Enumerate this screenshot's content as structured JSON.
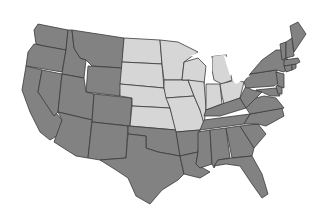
{
  "map": {
    "title": "United States - Midwest region highlighted",
    "colors": {
      "background": "#ffffff",
      "other_states": "#828282",
      "highlighted_states": "#d6d6d6",
      "borders": "#3a3a3a"
    },
    "legend_visible": false,
    "highlighted_region": "Midwest",
    "highlighted_states": [
      "ND",
      "SD",
      "NE",
      "KS",
      "MN",
      "IA",
      "MO",
      "WI",
      "IL",
      "MI",
      "IN",
      "OH"
    ],
    "states": [
      {
        "id": "WA",
        "region": "other",
        "points": "38,24 68,30 66,50 44,46 36,44 34,30"
      },
      {
        "id": "OR",
        "region": "other",
        "points": "34,44 44,46 66,50 62,72 26,66 28,52"
      },
      {
        "id": "CA",
        "region": "other",
        "points": "26,66 42,70 38,92 62,120 60,134 50,140 40,132 30,112 22,90"
      },
      {
        "id": "ID",
        "region": "other",
        "points": "68,30 72,30 74,48 80,58 86,60 84,78 62,74 66,50"
      },
      {
        "id": "NV",
        "region": "other",
        "points": "42,70 62,74 58,112 54,116 38,92"
      },
      {
        "id": "MT",
        "region": "other",
        "points": "72,30 124,38 122,68 92,66 86,60 80,58 74,48"
      },
      {
        "id": "WY",
        "region": "other",
        "points": "88,66 122,68 120,96 86,92"
      },
      {
        "id": "UT",
        "region": "other",
        "points": "62,74 84,78 86,92 94,94 92,120 58,112"
      },
      {
        "id": "CO",
        "region": "other",
        "points": "94,94 132,98 130,126 92,122"
      },
      {
        "id": "AZ",
        "region": "other",
        "points": "58,112 92,120 88,158 76,156 54,142 62,120"
      },
      {
        "id": "NM",
        "region": "other",
        "points": "92,122 128,126 126,158 100,160 88,158"
      },
      {
        "id": "ND",
        "region": "highlight",
        "points": "124,38 160,40 162,64 122,62"
      },
      {
        "id": "SD",
        "region": "highlight",
        "points": "122,62 162,64 164,88 120,84"
      },
      {
        "id": "NE",
        "region": "highlight",
        "points": "120,84 164,88 170,108 132,106 132,98 120,96"
      },
      {
        "id": "KS",
        "region": "highlight",
        "points": "132,106 170,108 176,130 130,126"
      },
      {
        "id": "OK",
        "region": "other",
        "points": "128,126 176,130 180,156 158,152 146,148 146,136 128,134"
      },
      {
        "id": "TX",
        "region": "other",
        "points": "128,134 146,136 146,148 158,152 180,156 184,174 178,180 162,190 150,204 136,196 128,178 116,170 100,160 126,158"
      },
      {
        "id": "MN",
        "region": "highlight",
        "points": "160,40 178,42 198,52 184,62 182,80 164,80 162,64"
      },
      {
        "id": "IA",
        "region": "highlight",
        "points": "164,80 188,80 194,96 166,98 164,88"
      },
      {
        "id": "MO",
        "region": "highlight",
        "points": "166,98 194,96 200,110 206,124 200,130 176,132 170,108"
      },
      {
        "id": "AR",
        "region": "other",
        "points": "176,132 200,130 198,152 180,156"
      },
      {
        "id": "LA",
        "region": "other",
        "points": "180,156 198,152 196,164 210,172 200,178 184,174"
      },
      {
        "id": "WI",
        "region": "highlight",
        "points": "184,62 198,58 206,66 204,84 188,80 182,80"
      },
      {
        "id": "IL",
        "region": "highlight",
        "points": "188,80 204,82 206,108 204,124 200,110 194,96"
      },
      {
        "id": "MI",
        "region": "highlight",
        "points": "212,56 226,54 232,80 222,84 214,80 212,70"
      },
      {
        "id": "IN",
        "region": "highlight",
        "points": "206,84 220,84 222,104 206,110"
      },
      {
        "id": "OH",
        "region": "highlight",
        "points": "220,84 236,80 244,82 240,98 224,104 222,96"
      },
      {
        "id": "KY",
        "region": "other",
        "points": "204,116 206,110 222,104 240,98 246,108 220,116"
      },
      {
        "id": "TN",
        "region": "other",
        "points": "200,130 204,120 250,114 244,124 200,130"
      },
      {
        "id": "MS",
        "region": "other",
        "points": "198,132 210,130 212,164 200,168 196,164 198,152"
      },
      {
        "id": "AL",
        "region": "other",
        "points": "210,130 226,128 230,158 218,160 214,168 212,164"
      },
      {
        "id": "GA",
        "region": "other",
        "points": "226,128 240,126 254,148 252,156 232,158"
      },
      {
        "id": "FL",
        "region": "other",
        "points": "214,166 218,160 232,158 252,156 262,174 268,194 262,198 252,184 240,166 226,164"
      },
      {
        "id": "SC",
        "region": "other",
        "points": "240,126 258,124 266,134 254,148"
      },
      {
        "id": "NC",
        "region": "other",
        "points": "244,124 250,114 282,108 284,116 266,126 258,124"
      },
      {
        "id": "VA",
        "region": "other",
        "points": "246,108 256,98 264,96 276,98 284,108 250,114"
      },
      {
        "id": "WV",
        "region": "other",
        "points": "240,98 246,86 252,90 262,92 256,98 246,108"
      },
      {
        "id": "PA",
        "region": "other",
        "points": "244,82 250,74 276,70 282,80 274,86 246,88"
      },
      {
        "id": "MD",
        "region": "other",
        "points": "256,90 276,88 280,96 270,96 262,92"
      },
      {
        "id": "DE",
        "region": "other",
        "points": "276,86 282,84 282,94 278,94"
      },
      {
        "id": "NJ",
        "region": "other",
        "points": "276,72 284,74 284,88 278,86"
      },
      {
        "id": "NY",
        "region": "other",
        "points": "250,74 262,60 276,50 286,50 288,66 284,72 276,70"
      },
      {
        "id": "CT",
        "region": "other",
        "points": "284,66 292,64 292,70 286,72"
      },
      {
        "id": "RI",
        "region": "other",
        "points": "292,64 296,64 296,68 292,70"
      },
      {
        "id": "MA",
        "region": "other",
        "points": "284,60 298,58 300,62 296,64 284,66"
      },
      {
        "id": "VT",
        "region": "other",
        "points": "280,44 286,42 286,58 282,60"
      },
      {
        "id": "NH",
        "region": "other",
        "points": "286,42 292,38 294,56 286,58"
      },
      {
        "id": "ME",
        "region": "other",
        "points": "290,26 298,22 306,34 302,40 294,52 292,38"
      }
    ],
    "lakes": [
      {
        "id": "lake-superior",
        "points": "190,56 204,50 222,50 230,54 212,56 202,58"
      },
      {
        "id": "lake-michigan",
        "points": "206,60 212,58 212,80 208,82"
      },
      {
        "id": "lake-huron",
        "points": "224,56 232,58 236,70 230,76"
      },
      {
        "id": "lake-erie",
        "points": "232,80 246,74 250,76 236,84"
      }
    ]
  }
}
